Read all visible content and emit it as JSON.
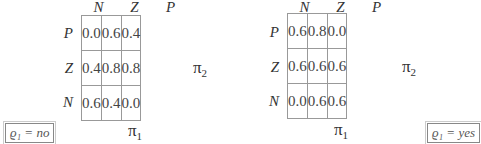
{
  "panels": [
    {
      "columns": [
        "N",
        "Z",
        "P"
      ],
      "rows": [
        "P",
        "Z",
        "N"
      ],
      "cells": [
        [
          "0.0",
          "0.6",
          "0.4"
        ],
        [
          "0.4",
          "0.8",
          "0.8"
        ],
        [
          "0.6",
          "0.4",
          "0.0"
        ]
      ],
      "x_axis": "π",
      "x_axis_sub": "1",
      "y_axis": "π",
      "y_axis_sub": "2",
      "tag": "ϱ₁ = no"
    },
    {
      "columns": [
        "N",
        "Z",
        "P"
      ],
      "rows": [
        "P",
        "Z",
        "N"
      ],
      "cells": [
        [
          "0.6",
          "0.8",
          "0.0"
        ],
        [
          "0.6",
          "0.6",
          "0.6"
        ],
        [
          "0.0",
          "0.6",
          "0.6"
        ]
      ],
      "x_axis": "π",
      "x_axis_sub": "1",
      "y_axis": "π",
      "y_axis_sub": "2",
      "tag": "ϱ₁ = yes"
    }
  ]
}
